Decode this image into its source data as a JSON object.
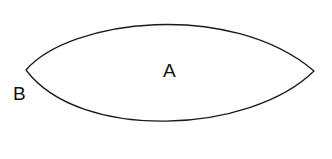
{
  "figure": {
    "type": "geometry-diagram",
    "background_color": "#ffffff",
    "stroke_color": "#1a1a1a",
    "fill_color": "#ffffff",
    "stroke_width": 1.3,
    "width": 332,
    "height": 159
  },
  "shape": {
    "name": "lens",
    "description": "lens (vesica) shape formed by two circular arcs meeting at left and right cusps",
    "left_vertex": {
      "x": 26,
      "y": 70
    },
    "right_vertex": {
      "x": 314,
      "y": 71
    },
    "top_apex": {
      "x": 170,
      "y": 12
    },
    "bottom_apex": {
      "x": 168,
      "y": 130
    },
    "path": "M 26 70 C 70 19, 230 0, 314 71 C 250 134, 80 142, 26 70 Z"
  },
  "labels": [
    {
      "id": "A",
      "text": "A",
      "position": "interior",
      "x": 163,
      "y": 61
    },
    {
      "id": "B",
      "text": "B",
      "position": "exterior-left",
      "x": 13,
      "y": 84
    }
  ]
}
